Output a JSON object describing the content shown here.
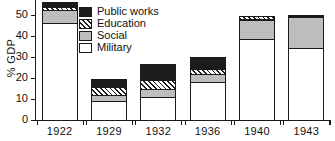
{
  "chart_data": {
    "type": "bar",
    "title": "",
    "subtitle": "",
    "xlabel": "",
    "ylabel": "% GDP",
    "categories": [
      "1922",
      "1929",
      "1932",
      "1936",
      "1940",
      "1943"
    ],
    "ylim": [
      0,
      57
    ],
    "yticks": [
      0,
      10,
      20,
      30,
      40,
      50
    ],
    "ytick_labels": [
      "0",
      "10",
      "20",
      "30",
      "40",
      "50"
    ],
    "grid": false,
    "stacked": true,
    "legend_position": "inside-top-left",
    "series": [
      {
        "name": "Military",
        "fill": "white",
        "values": [
          46.0,
          9.0,
          11.0,
          18.0,
          38.5,
          34.5
        ]
      },
      {
        "name": "Social",
        "fill": "gray",
        "values": [
          6.5,
          3.0,
          4.0,
          4.0,
          9.0,
          14.5
        ]
      },
      {
        "name": "Education",
        "fill": "hatched",
        "values": [
          1.5,
          3.5,
          4.0,
          2.5,
          2.0,
          1.0
        ]
      },
      {
        "name": "Public works",
        "fill": "black",
        "values": [
          2.0,
          4.0,
          7.5,
          5.5,
          0.0,
          0.0
        ]
      }
    ],
    "totals": [
      56.0,
      19.5,
      26.5,
      30.0,
      49.5,
      50.0
    ],
    "colors": {
      "military": "#ffffff",
      "social": "#bdbdbd",
      "education": "#1a1a1a",
      "public_works": "#1c1c1c",
      "axis": "#1a1a1a",
      "text": "#101010"
    }
  },
  "legend": {
    "items": [
      {
        "label": "Public works",
        "key": "public"
      },
      {
        "label": "Education",
        "key": "education"
      },
      {
        "label": "Social",
        "key": "social"
      },
      {
        "label": "Military",
        "key": "military"
      }
    ]
  }
}
